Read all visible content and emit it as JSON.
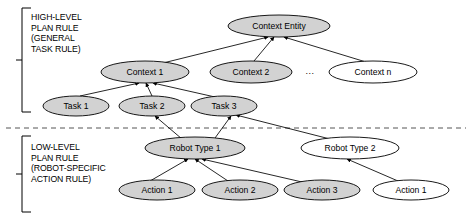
{
  "diagram": {
    "type": "hierarchy-graph",
    "groups": [
      {
        "id": "high-level",
        "caption": "HIGH-LEVEL\nPLAN RULE\n(GENERAL\nTASK RULE)",
        "bracket": {
          "x": 22,
          "top": 8,
          "bottom": 112,
          "tick_y": 60
        }
      },
      {
        "id": "low-level",
        "caption": "LOW-LEVEL\nPLAN RULE\n(ROBOT-SPECIFIC\nACTION RULE)",
        "bracket": {
          "x": 22,
          "top": 136,
          "bottom": 212,
          "tick_y": 174
        }
      }
    ],
    "divider": {
      "y": 128,
      "x1": 6,
      "x2": 466,
      "style": "dashed"
    },
    "ellipsis": {
      "label": "...",
      "x": 310,
      "y": 72
    },
    "colors": {
      "node_fill_gray": "#d2d2d2",
      "node_fill_white": "#ffffff",
      "stroke": "#000000",
      "divider": "#555555"
    },
    "nodes": [
      {
        "id": "context-entity",
        "label": "Context Entity",
        "cx": 279,
        "cy": 26,
        "rx": 51,
        "ry": 11,
        "fill": "gray"
      },
      {
        "id": "context-1",
        "label": "Context 1",
        "cx": 145,
        "cy": 72,
        "rx": 44,
        "ry": 11,
        "fill": "gray"
      },
      {
        "id": "context-2",
        "label": "Context 2",
        "cx": 251,
        "cy": 72,
        "rx": 41,
        "ry": 11,
        "fill": "gray"
      },
      {
        "id": "context-n",
        "label": "Context n",
        "cx": 373,
        "cy": 72,
        "rx": 44,
        "ry": 11,
        "fill": "white"
      },
      {
        "id": "task-1",
        "label": "Task 1",
        "cx": 76,
        "cy": 106,
        "rx": 33,
        "ry": 10,
        "fill": "gray"
      },
      {
        "id": "task-2",
        "label": "Task 2",
        "cx": 152,
        "cy": 106,
        "rx": 33,
        "ry": 10,
        "fill": "gray"
      },
      {
        "id": "task-3",
        "label": "Task 3",
        "cx": 224,
        "cy": 106,
        "rx": 33,
        "ry": 10,
        "fill": "gray"
      },
      {
        "id": "robot-type-1",
        "label": "Robot Type 1",
        "cx": 195,
        "cy": 148,
        "rx": 50,
        "ry": 11,
        "fill": "gray"
      },
      {
        "id": "robot-type-2",
        "label": "Robot Type 2",
        "cx": 350,
        "cy": 148,
        "rx": 49,
        "ry": 11,
        "fill": "white"
      },
      {
        "id": "action-1a",
        "label": "Action 1",
        "cx": 157,
        "cy": 190,
        "rx": 38,
        "ry": 10,
        "fill": "gray"
      },
      {
        "id": "action-2",
        "label": "Action 2",
        "cx": 240,
        "cy": 190,
        "rx": 38,
        "ry": 10,
        "fill": "gray"
      },
      {
        "id": "action-3",
        "label": "Action 3",
        "cx": 322,
        "cy": 190,
        "rx": 38,
        "ry": 10,
        "fill": "gray"
      },
      {
        "id": "action-1b",
        "label": "Action 1",
        "cx": 411,
        "cy": 190,
        "rx": 38,
        "ry": 10,
        "fill": "white"
      }
    ],
    "edges": [
      {
        "from": "context-1",
        "to": "context-entity",
        "arrow": true,
        "x1": 163,
        "y1": 63,
        "x2": 268,
        "y2": 37
      },
      {
        "from": "context-2",
        "to": "context-entity",
        "arrow": true,
        "x1": 254,
        "y1": 61,
        "x2": 274,
        "y2": 37
      },
      {
        "from": "context-n",
        "to": "context-entity",
        "arrow": true,
        "x1": 366,
        "y1": 62,
        "x2": 284,
        "y2": 37
      },
      {
        "from": "task-1",
        "to": "context-1",
        "arrow": true,
        "x1": 80,
        "y1": 96,
        "x2": 139,
        "y2": 83
      },
      {
        "from": "task-2",
        "to": "context-1",
        "arrow": true,
        "x1": 152,
        "y1": 96,
        "x2": 146,
        "y2": 83
      },
      {
        "from": "task-3",
        "to": "context-1",
        "arrow": true,
        "x1": 215,
        "y1": 97,
        "x2": 153,
        "y2": 83
      },
      {
        "from": "robot-type-1",
        "to": "task-2",
        "arrow": true,
        "x1": 182,
        "y1": 139,
        "x2": 155,
        "y2": 116
      },
      {
        "from": "robot-type-1",
        "to": "task-3",
        "arrow": true,
        "x1": 215,
        "y1": 138,
        "x2": 231,
        "y2": 116
      },
      {
        "from": "robot-type-2",
        "to": "task-3",
        "arrow": true,
        "x1": 330,
        "y1": 139,
        "x2": 236,
        "y2": 115
      },
      {
        "from": "action-1a",
        "to": "robot-type-1",
        "arrow": true,
        "x1": 150,
        "y1": 181,
        "x2": 188,
        "y2": 159
      },
      {
        "from": "action-2",
        "to": "robot-type-1",
        "arrow": true,
        "x1": 228,
        "y1": 181,
        "x2": 195,
        "y2": 159
      },
      {
        "from": "action-3",
        "to": "robot-type-1",
        "arrow": true,
        "x1": 302,
        "y1": 182,
        "x2": 202,
        "y2": 159
      },
      {
        "from": "action-1b",
        "to": "robot-type-2",
        "arrow": true,
        "x1": 398,
        "y1": 181,
        "x2": 347,
        "y2": 159
      }
    ]
  }
}
